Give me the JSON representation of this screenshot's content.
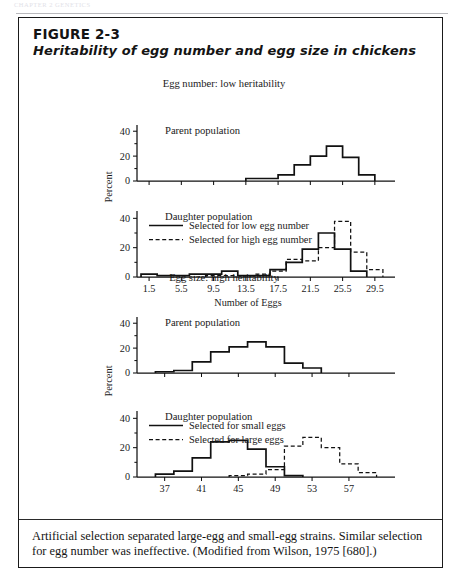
{
  "running_head": "CHAPTER 2   GENETICS",
  "figure": {
    "number": "FIGURE 2-3",
    "title": "Heritability of egg number and egg size in chickens",
    "caption": "Artificial selection separated large-egg and small-egg strains. Similar selection for egg number was ineffective. (Modified from Wilson, 1975 [680].)"
  },
  "panels": {
    "egg_number_heading": "Egg number: low heritability",
    "egg_size_heading": "Egg size: high heritability",
    "parent_label": "Parent population",
    "daughter_label": "Daughter population",
    "y_axis_label": "Percent",
    "legend_number_solid": "Selected for low egg number",
    "legend_number_dashed": "Selected for high egg number",
    "legend_size_solid": "Selected for small eggs",
    "legend_size_dashed": "Selected for large eggs"
  },
  "chart_data": [
    {
      "id": "egg-number-parent",
      "type": "bar",
      "title": "Parent population",
      "group": "Egg number: low heritability",
      "xlabel": "Number of Eggs",
      "ylabel": "Percent",
      "xlim": [
        0,
        32
      ],
      "ylim": [
        0,
        45
      ],
      "yticks": [
        0,
        20,
        40
      ],
      "yminor": [
        10,
        30
      ],
      "xticks": [
        1.5,
        5.5,
        9.5,
        13.5,
        17.5,
        21.5,
        25.5,
        29.5
      ],
      "bin_width": 2,
      "bin_starts": [
        13.5,
        15.5,
        17.5,
        19.5,
        21.5,
        23.5,
        25.5,
        27.5
      ],
      "values": [
        2,
        2,
        5,
        13,
        20,
        28,
        19,
        5
      ],
      "series_name": "Parent population"
    },
    {
      "id": "egg-number-daughter",
      "type": "bar",
      "title": "Daughter population",
      "group": "Egg number: low heritability",
      "xlabel": "Number of Eggs",
      "ylabel": "Percent",
      "xlim": [
        0,
        32
      ],
      "ylim": [
        0,
        45
      ],
      "yticks": [
        0,
        20,
        40
      ],
      "yminor": [
        10,
        30
      ],
      "xticks": [
        1.5,
        5.5,
        9.5,
        13.5,
        17.5,
        21.5,
        25.5,
        29.5
      ],
      "bin_width": 2,
      "series": [
        {
          "name": "Selected for low egg number",
          "style": "solid",
          "bin_starts": [
            0.5,
            2.5,
            4.5,
            6.5,
            8.5,
            10.5,
            12.5,
            14.5,
            16.5,
            18.5,
            20.5,
            22.5,
            24.5,
            26.5
          ],
          "values": [
            2,
            1,
            1,
            2,
            2,
            4,
            1,
            1,
            5,
            10,
            19,
            30,
            19,
            4
          ]
        },
        {
          "name": "Selected for high egg number",
          "style": "dashed",
          "bin_starts": [
            8.5,
            10.5,
            12.5,
            14.5,
            16.5,
            18.5,
            20.5,
            22.5,
            24.5,
            26.5,
            28.5
          ],
          "values": [
            1,
            1,
            1,
            2,
            4,
            12,
            11,
            20,
            38,
            17,
            5
          ]
        }
      ]
    },
    {
      "id": "egg-size-parent",
      "type": "bar",
      "title": "Parent population",
      "group": "Egg size: high heritability",
      "xlabel": "Average Egg Weight, g",
      "ylabel": "Percent",
      "xlim": [
        34,
        62
      ],
      "ylim": [
        0,
        45
      ],
      "yticks": [
        0,
        20,
        40
      ],
      "yminor": [
        10,
        30
      ],
      "xticks": [
        37,
        41,
        45,
        49,
        53,
        57
      ],
      "bin_width": 2,
      "bin_starts": [
        36,
        38,
        40,
        42,
        44,
        46,
        48,
        50,
        52
      ],
      "values": [
        1,
        2,
        9,
        17,
        21,
        25,
        21,
        8,
        4
      ],
      "series_name": "Parent population"
    },
    {
      "id": "egg-size-daughter",
      "type": "bar",
      "title": "Daughter population",
      "group": "Egg size: high heritability",
      "xlabel": "Average Egg Weight, g",
      "ylabel": "Percent",
      "xlim": [
        34,
        62
      ],
      "ylim": [
        0,
        45
      ],
      "yticks": [
        0,
        20,
        40
      ],
      "yminor": [
        10,
        30
      ],
      "xticks": [
        37,
        41,
        45,
        49,
        53,
        57
      ],
      "bin_width": 2,
      "series": [
        {
          "name": "Selected for small eggs",
          "style": "solid",
          "bin_starts": [
            36,
            38,
            40,
            42,
            44,
            46,
            48,
            50
          ],
          "values": [
            2,
            4,
            13,
            24,
            25,
            19,
            7,
            1
          ]
        },
        {
          "name": "Selected for large eggs",
          "style": "dashed",
          "bin_starts": [
            44,
            46,
            48,
            50,
            52,
            54,
            56,
            58
          ],
          "values": [
            1,
            2,
            5,
            21,
            27,
            20,
            9,
            3
          ]
        }
      ]
    }
  ]
}
